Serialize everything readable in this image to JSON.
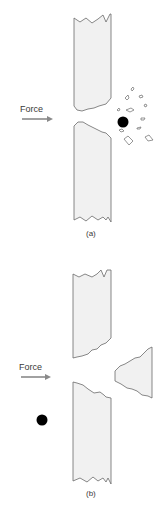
{
  "panels": [
    {
      "id": "a",
      "caption": "(a)",
      "force_label": "Force",
      "description": "Projectile passes through the plate; small fragments scatter on the far side"
    },
    {
      "id": "b",
      "caption": "(b)",
      "force_label": "Force",
      "description": "Plate ejects a large plug (spall) opposite the impact; projectile remains on the near side"
    }
  ],
  "colors": {
    "plate_fill": "#f1f1f1",
    "outline": "#6a6a6a",
    "projectile": "#000000",
    "arrow": "#8a8a8a",
    "text": "#3a3a3a"
  }
}
